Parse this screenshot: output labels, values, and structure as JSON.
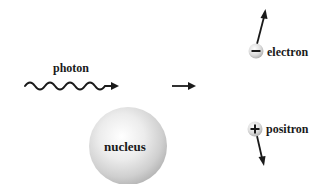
{
  "diagram": {
    "type": "pair-production",
    "labels": {
      "photon": "photon",
      "nucleus": "nucleus",
      "electron": "electron",
      "positron": "positron"
    },
    "particles": {
      "electron": {
        "charge_symbol": "−",
        "charge": "negative"
      },
      "positron": {
        "charge_symbol": "+",
        "charge": "positive"
      }
    },
    "elements": [
      {
        "id": "photon-wave",
        "kind": "wavy-arrow",
        "direction": "right"
      },
      {
        "id": "nucleus",
        "kind": "sphere"
      },
      {
        "id": "process-arrow",
        "kind": "arrow",
        "direction": "right"
      },
      {
        "id": "electron-track",
        "kind": "arrow",
        "direction": "up"
      },
      {
        "id": "positron-track",
        "kind": "arrow",
        "direction": "down"
      }
    ],
    "colors": {
      "ink": "#1a1a1a",
      "sphere_highlight": "#ffffff",
      "sphere_shadow": "#b0b0b0",
      "background": "#ffffff"
    }
  }
}
